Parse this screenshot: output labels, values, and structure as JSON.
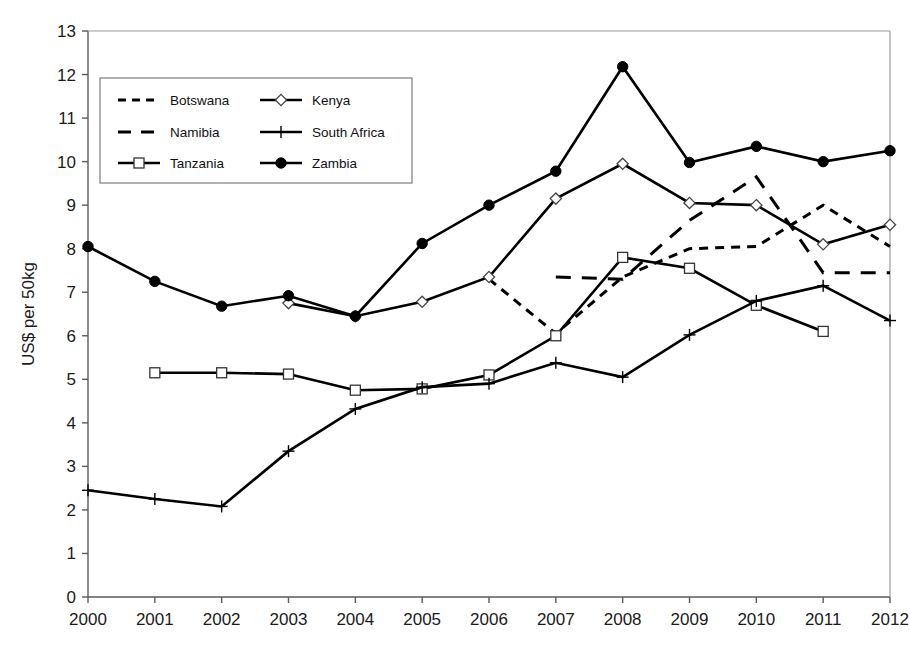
{
  "chart_data": {
    "type": "line",
    "title": "",
    "xlabel": "",
    "ylabel": "US$ per 50kg",
    "x": [
      2000,
      2001,
      2002,
      2003,
      2004,
      2005,
      2006,
      2007,
      2008,
      2009,
      2010,
      2011,
      2012
    ],
    "categories": [
      "2000",
      "2001",
      "2002",
      "2003",
      "2004",
      "2005",
      "2006",
      "2007",
      "2008",
      "2009",
      "2010",
      "2011",
      "2012"
    ],
    "xlim": [
      2000,
      2012
    ],
    "ylim": [
      0,
      13
    ],
    "ytick_labels": [
      "0",
      "1",
      "2",
      "3",
      "4",
      "5",
      "6",
      "7",
      "8",
      "9",
      "10",
      "11",
      "12",
      "13"
    ],
    "ytick_values": [
      0,
      1,
      2,
      3,
      4,
      5,
      6,
      7,
      8,
      9,
      10,
      11,
      12,
      13
    ],
    "grid": false,
    "legend_position": "upper-left-inside",
    "series": [
      {
        "name": "Botswana",
        "style": "short-dash",
        "marker": "none",
        "color": "#000000",
        "x": [
          2006,
          2007,
          2008,
          2009,
          2010,
          2011,
          2012
        ],
        "values": [
          7.3,
          6.05,
          7.35,
          8.0,
          8.05,
          9.0,
          8.05
        ]
      },
      {
        "name": "Namibia",
        "style": "long-dash",
        "marker": "none",
        "color": "#000000",
        "x": [
          2007,
          2008,
          2009,
          2010,
          2011,
          2012
        ],
        "values": [
          7.35,
          7.3,
          8.65,
          9.65,
          7.45,
          7.45
        ]
      },
      {
        "name": "Tanzania",
        "style": "solid",
        "marker": "open-square",
        "color": "#000000",
        "x": [
          2001,
          2002,
          2003,
          2004,
          2005,
          2006,
          2007,
          2008,
          2009,
          2010,
          2011
        ],
        "values": [
          5.15,
          5.15,
          5.12,
          4.75,
          4.78,
          5.1,
          6.0,
          7.8,
          7.55,
          6.7,
          6.1
        ]
      },
      {
        "name": "Kenya",
        "style": "solid",
        "marker": "open-diamond",
        "color": "#000000",
        "x": [
          2003,
          2004,
          2005,
          2006,
          2007,
          2008,
          2009,
          2010,
          2011,
          2012
        ],
        "values": [
          6.75,
          6.45,
          6.78,
          7.35,
          9.15,
          9.95,
          9.05,
          9.0,
          8.1,
          8.55
        ]
      },
      {
        "name": "South Africa",
        "style": "solid",
        "marker": "plus",
        "color": "#000000",
        "x": [
          2000,
          2001,
          2002,
          2003,
          2004,
          2005,
          2006,
          2007,
          2008,
          2009,
          2010,
          2011,
          2012
        ],
        "values": [
          2.45,
          2.25,
          2.08,
          3.35,
          4.32,
          4.82,
          4.9,
          5.38,
          5.05,
          6.02,
          6.8,
          7.15,
          6.35
        ]
      },
      {
        "name": "Zambia",
        "style": "solid",
        "marker": "filled-circle",
        "color": "#000000",
        "x": [
          2000,
          2001,
          2002,
          2003,
          2004,
          2005,
          2006,
          2007,
          2008,
          2009,
          2010,
          2011,
          2012
        ],
        "values": [
          8.05,
          7.25,
          6.68,
          6.92,
          6.45,
          8.12,
          9.0,
          9.78,
          12.18,
          9.98,
          10.35,
          10.0,
          10.25
        ]
      }
    ]
  },
  "legend": {
    "entries": [
      {
        "label": "Botswana"
      },
      {
        "label": "Kenya"
      },
      {
        "label": "Namibia"
      },
      {
        "label": "South Africa"
      },
      {
        "label": "Tanzania"
      },
      {
        "label": "Zambia"
      }
    ]
  },
  "axis": {
    "y_title": "US$ per 50kg"
  }
}
